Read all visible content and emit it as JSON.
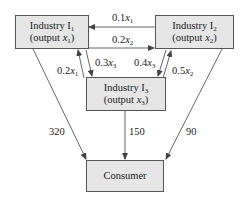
{
  "nodes": {
    "industry1": {
      "title": "Industry I",
      "title_sub": "1",
      "output_prefix": "(output ",
      "output_var": "x",
      "output_sub": "1",
      "output_suffix": ")"
    },
    "industry2": {
      "title": "Industry I",
      "title_sub": "2",
      "output_prefix": "(output ",
      "output_var": "x",
      "output_sub": "2",
      "output_suffix": ")"
    },
    "industry3": {
      "title": "Industry I",
      "title_sub": "3",
      "output_prefix": "(output ",
      "output_var": "x",
      "output_sub": "3",
      "output_suffix": ")"
    },
    "consumer": {
      "title": "Consumer"
    }
  },
  "edges": {
    "i2_to_i1": {
      "coef": "0.1",
      "var": "x",
      "sub": "1"
    },
    "i1_to_i2": {
      "coef": "0.2",
      "var": "x",
      "sub": "2"
    },
    "i3_to_i1": {
      "coef": "0.2",
      "var": "x",
      "sub": "1"
    },
    "i1_to_i3": {
      "coef": "0.3",
      "var": "x",
      "sub": "3"
    },
    "i2_to_i3": {
      "coef": "0.4",
      "var": "x",
      "sub": "3"
    },
    "i3_to_i2": {
      "coef": "0.5",
      "var": "x",
      "sub": "2"
    },
    "i1_to_consumer": {
      "value": "320"
    },
    "i3_to_consumer": {
      "value": "150"
    },
    "i2_to_consumer": {
      "value": "90"
    }
  },
  "colors": {
    "box_fill": "#e6e6e6",
    "line": "#555555"
  }
}
